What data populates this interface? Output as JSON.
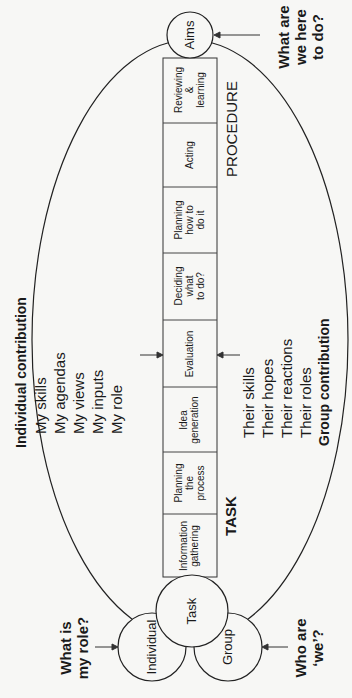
{
  "diagram": {
    "circles": {
      "aims": "Aims",
      "task": "Task",
      "individual": "Individual",
      "group": "Group"
    },
    "questions": {
      "aims": [
        "What are",
        "we here",
        "to do?"
      ],
      "individual": [
        "What is",
        "my role?"
      ],
      "group": [
        "Who are",
        "‘we’?"
      ]
    },
    "process_steps": [
      {
        "label": "Information gathering",
        "lines": [
          "Information",
          "gathering"
        ]
      },
      {
        "label": "Planning the process",
        "lines": [
          "Planning",
          "the",
          "process"
        ]
      },
      {
        "label": "Idea generation",
        "lines": [
          "Idea",
          "generation"
        ]
      },
      {
        "label": "Evaluation",
        "lines": [
          "Evaluation"
        ]
      },
      {
        "label": "Deciding what to do?",
        "lines": [
          "Deciding",
          "what",
          "to do?"
        ]
      },
      {
        "label": "Planning how to do it",
        "lines": [
          "Planning",
          "how to",
          "do it"
        ]
      },
      {
        "label": "Acting",
        "lines": [
          "Acting"
        ]
      },
      {
        "label": "Reviewing & learning",
        "lines": [
          "Reviewing",
          "&",
          "learning"
        ]
      }
    ],
    "section_labels": {
      "task": "TASK",
      "procedure": "PROCEDURE"
    },
    "individual_contribution": {
      "heading": "Individual contribution",
      "items": [
        "My skills",
        "My agendas",
        "My views",
        "My inputs",
        "My role"
      ]
    },
    "group_contribution": {
      "heading": "Group contribution",
      "items": [
        "Their skills",
        "Their hopes",
        "Their reactions",
        "Their roles"
      ]
    }
  }
}
